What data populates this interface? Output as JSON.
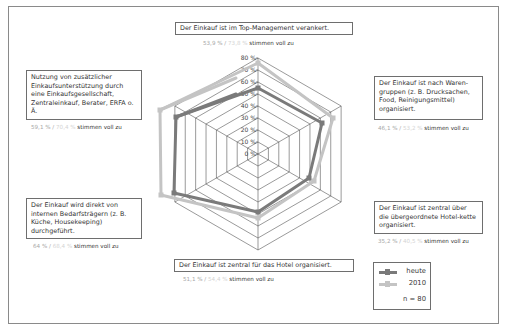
{
  "chart_data": {
    "type": "radar",
    "title": "",
    "categories": [
      "Der Einkauf ist im Top-Management verankert.",
      "Der Einkauf ist nach Warengruppen (z. B. Drucksachen, Food, Reinigungsmittel) organisiert.",
      "Der Einkauf ist zentral über die übergeordnete Hotelkette organisiert.",
      "Der Einkauf ist zentral für das Hotel organisiert.",
      "Der Einkauf wird direkt von internen Bedarfsträgern (z. B. Küche, Housekeeping) durchgeführt.",
      "Nutzung von zusätzlicher Einkaufsunterstützung durch eine Einkaufsgesellschaft, Zentraleinkauf, Berater, ERFA o. Ä."
    ],
    "series": [
      {
        "name": "heute",
        "color": "#7a7a7a",
        "values": [
          53.9,
          46.1,
          35.2,
          51.1,
          64.0,
          59.1
        ]
      },
      {
        "name": "2010",
        "color": "#c4c4c4",
        "values": [
          73.8,
          53.2,
          40.5,
          54.4,
          68.4,
          70.4
        ]
      }
    ],
    "values_source": "Series values are the percentages printed in the caption under each axis label.",
    "plot_caption_mismatch": "On the top axis the plotted points agree with the caption values. On the other five axes the points are drawn noticeably further out than the caption percentages, so the plot and the labels are not mutually consistent. The rendered polygons use the measured pixel positions; the values above are the captioned numbers, not values read off the plot.",
    "radial_axis": {
      "min": 0,
      "max": 80,
      "step": 10,
      "unit": "%",
      "tick_labels": [
        "0 %",
        "10 %",
        "20 %",
        "30 %",
        "40 %",
        "50 %",
        "60 %",
        "70 %",
        "80 %"
      ]
    },
    "grid": true,
    "legend_position": "bottom-right",
    "annotation": "n = 80"
  },
  "ui": {
    "center": {
      "x": 258,
      "y": 154
    },
    "radius_px": 96,
    "rings": 8,
    "rendered_points_note": "Pixel coordinates of each series vertex, measured from the screenshot, in axis order top, upper-right, lower-right, bottom, lower-left, upper-left.",
    "rendered_points": {
      "heute": [
        [
          258,
          88
        ],
        [
          322,
          123
        ],
        [
          309,
          178
        ],
        [
          258,
          212
        ],
        [
          174,
          193
        ],
        [
          176,
          117
        ]
      ],
      "2010": [
        [
          258,
          63
        ],
        [
          333,
          118
        ],
        [
          314,
          181
        ],
        [
          258,
          218
        ],
        [
          161,
          195
        ],
        [
          160,
          110
        ]
      ]
    },
    "upper_left_lead_segments": {
      "heute": [
        [
          176,
          117
        ],
        [
          236,
          94
        ]
      ],
      "2010": [
        [
          160,
          110
        ],
        [
          236,
          78
        ]
      ]
    }
  },
  "labels": {
    "top": {
      "text": "Der Einkauf ist im Top-Management verankert.",
      "v1": "53,9 %",
      "v2": "73,8 %",
      "suffix": "stimmen voll zu"
    },
    "upper_right": {
      "text": "Der Einkauf ist nach Waren-gruppen (z. B. Drucksachen, Food, Reinigungsmittel) organisiert.",
      "v1": "46,1 %",
      "v2": "53,2 %",
      "suffix": "stimmen voll zu"
    },
    "lower_right": {
      "text": "Der Einkauf ist zentral über die übergeordnete Hotel-kette organisiert.",
      "v1": "35,2 %",
      "v2": "40,5 %",
      "suffix": "stimmen voll zu"
    },
    "bottom": {
      "text": "Der Einkauf ist zentral für das Hotel organisiert.",
      "v1": "51,1 %",
      "v2": "54,4 %",
      "suffix": "stimmen voll zu"
    },
    "lower_left": {
      "text": "Der Einkauf wird direkt von internen Bedarfsträgern (z. B. Küche, Housekeeping) durchgeführt.",
      "v1": "64 %",
      "v2": "68,4 %",
      "suffix": "stimmen voll zu"
    },
    "upper_left": {
      "text": "Nutzung von zusätzlicher Einkaufsunterstützung durch eine Einkaufsgesellschaft, Zentraleinkauf, Berater, ERFA o. Ä.",
      "v1": "59,1 %",
      "v2": "70,4 %",
      "suffix": "stimmen voll zu"
    },
    "separator": "/"
  },
  "legend": {
    "items": [
      {
        "label": "heute",
        "color": "#7a7a7a"
      },
      {
        "label": "2010",
        "color": "#c4c4c4"
      }
    ],
    "n_label": "n = 80"
  }
}
